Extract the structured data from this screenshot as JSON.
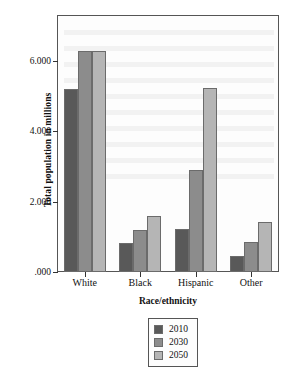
{
  "chart_data": {
    "type": "bar",
    "title": "",
    "xlabel": "Race/ethnicity",
    "ylabel": "Total population in millions",
    "categories": [
      "White",
      "Black",
      "Hispanic",
      "Other"
    ],
    "series": [
      {
        "name": "2010",
        "color": "#595959",
        "values": [
          5.2,
          0.81,
          1.21,
          0.45
        ]
      },
      {
        "name": "2030",
        "color": "#8c8c8c",
        "values": [
          6.27,
          1.19,
          2.9,
          0.85
        ]
      },
      {
        "name": "2050",
        "color": "#b5b5b5",
        "values": [
          6.27,
          1.58,
          5.23,
          1.42
        ]
      }
    ],
    "ylim": [
      0,
      7.3
    ],
    "yticks": [
      0,
      2,
      4,
      6
    ],
    "ytick_labels": [
      ".000",
      "2.000",
      "4.000",
      "6.000"
    ],
    "grid": false,
    "legend_position": "bottom-center",
    "frame": true
  },
  "legend": {
    "items": [
      {
        "label": "2010"
      },
      {
        "label": "2030"
      },
      {
        "label": "2050"
      }
    ]
  },
  "colors": {
    "series_2010": "#595959",
    "series_2030": "#8c8c8c",
    "series_2050": "#b5b5b5",
    "frame": "#555555",
    "background": "#ffffff"
  }
}
